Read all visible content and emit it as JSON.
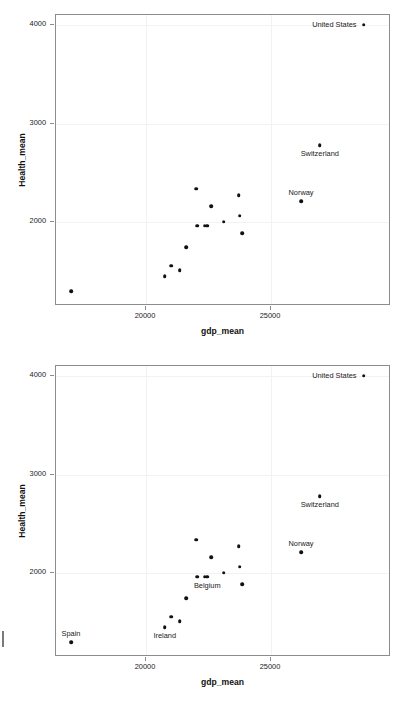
{
  "figure_count": 2,
  "axis": {
    "xlabel": "gdp_mean",
    "ylabel": "Health_mean",
    "x_ticks": [
      "20000",
      "25000"
    ],
    "x_tick_values": [
      20000,
      25000
    ],
    "y_ticks": [
      "4000",
      "3000",
      "2000"
    ],
    "y_tick_values": [
      4000,
      3000,
      2000
    ],
    "xlim": [
      16400,
      29800
    ],
    "ylim": [
      1150,
      4100
    ]
  },
  "colors": {
    "point": "#111111",
    "frame": "#8c8c8c",
    "grid": "#f2f2f2",
    "text": "#1a1a1a",
    "background": "#ffffff"
  },
  "chart_data": [
    {
      "type": "scatter",
      "title": "",
      "xlabel": "gdp_mean",
      "ylabel": "Health_mean",
      "xlim": [
        16400,
        29800
      ],
      "ylim": [
        1150,
        4100
      ],
      "grid": true,
      "legend": "none",
      "x": [
        28700,
        26950,
        26200,
        17000,
        20750,
        21000,
        21350,
        21600,
        22000,
        22050,
        22350,
        22450,
        22600,
        23100,
        23700,
        23750,
        23850
      ],
      "y": [
        4000,
        2780,
        2215,
        1300,
        1450,
        1560,
        1510,
        1745,
        2340,
        1965,
        1965,
        1965,
        2160,
        2005,
        2275,
        2065,
        1885
      ],
      "labels": [
        {
          "text": "United States",
          "x": 28700,
          "y": 4000,
          "pos": "left"
        },
        {
          "text": "Switzerland",
          "x": 26950,
          "y": 2780,
          "pos": "below"
        },
        {
          "text": "Norway",
          "x": 26200,
          "y": 2215,
          "pos": "above"
        }
      ]
    },
    {
      "type": "scatter",
      "title": "",
      "xlabel": "gdp_mean",
      "ylabel": "Health_mean",
      "xlim": [
        16400,
        29800
      ],
      "ylim": [
        1150,
        4100
      ],
      "grid": true,
      "legend": "none",
      "x": [
        28700,
        26950,
        26200,
        17000,
        20750,
        21000,
        21350,
        21600,
        22000,
        22050,
        22350,
        22450,
        22600,
        23100,
        23700,
        23750,
        23850
      ],
      "y": [
        4000,
        2780,
        2215,
        1300,
        1450,
        1560,
        1510,
        1745,
        2340,
        1965,
        1965,
        1965,
        2160,
        2005,
        2275,
        2065,
        1885
      ],
      "labels": [
        {
          "text": "United States",
          "x": 28700,
          "y": 4000,
          "pos": "left"
        },
        {
          "text": "Switzerland",
          "x": 26950,
          "y": 2780,
          "pos": "below"
        },
        {
          "text": "Norway",
          "x": 26200,
          "y": 2215,
          "pos": "above"
        },
        {
          "text": "Spain",
          "x": 17000,
          "y": 1300,
          "pos": "above"
        },
        {
          "text": "Ireland",
          "x": 20750,
          "y": 1450,
          "pos": "below"
        },
        {
          "text": "Belgium",
          "x": 22450,
          "y": 1965,
          "pos": "below"
        }
      ]
    }
  ]
}
